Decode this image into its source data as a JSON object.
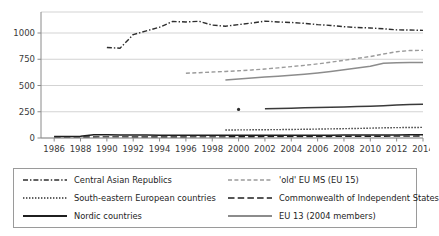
{
  "chart_data": {
    "type": "line",
    "title": "",
    "xlabel": "",
    "ylabel": "",
    "xlim": [
      1985,
      2014
    ],
    "ylim": [
      0,
      1200
    ],
    "yticks": [
      0,
      250,
      500,
      750,
      1000
    ],
    "xticks": [
      1986,
      1988,
      1990,
      1992,
      1994,
      1996,
      1998,
      2000,
      2002,
      2004,
      2006,
      2008,
      2010,
      2012,
      2014
    ],
    "grid": "horizontal",
    "legend_position": "below",
    "series": [
      {
        "name": "Central Asian Republics",
        "style": "dash-dot",
        "color": "#2e2e2e",
        "x": [
          1990,
          1991,
          1992,
          1993,
          1994,
          1995,
          1996,
          1997,
          1998,
          1999,
          2000,
          2001,
          2002,
          2003,
          2004,
          2005,
          2006,
          2007,
          2008,
          2009,
          2010,
          2011,
          2012,
          2013,
          2014
        ],
        "values": [
          862,
          855,
          985,
          1020,
          1055,
          1110,
          1105,
          1112,
          1075,
          1065,
          1080,
          1095,
          1113,
          1105,
          1100,
          1092,
          1080,
          1072,
          1060,
          1052,
          1048,
          1040,
          1030,
          1028,
          1025
        ]
      },
      {
        "name": "'old' EU MS (EU 15)",
        "style": "dash",
        "color": "#9b9b9b",
        "x": [
          1996,
          1997,
          1998,
          1999,
          2000,
          2001,
          2002,
          2003,
          2004,
          2005,
          2006,
          2007,
          2008,
          2009,
          2010,
          2011,
          2012,
          2013,
          2014
        ],
        "values": [
          617,
          622,
          628,
          634,
          640,
          648,
          657,
          668,
          680,
          692,
          706,
          722,
          740,
          758,
          776,
          800,
          822,
          833,
          835
        ]
      },
      {
        "name": "South-eastern European countries",
        "style": "dot",
        "color": "#2e2e2e",
        "x": [
          1999,
          2000,
          2001,
          2002,
          2003,
          2004,
          2005,
          2006,
          2007,
          2008,
          2009,
          2010,
          2011,
          2012,
          2013,
          2014
        ],
        "values": [
          76,
          77,
          78,
          79,
          80,
          81,
          83,
          85,
          87,
          89,
          91,
          94,
          97,
          99,
          100,
          101
        ]
      },
      {
        "name": "Commonwealth of Independent States",
        "style": "long-dash",
        "color": "#1f1f1f",
        "x": [
          1986,
          1987,
          1988,
          1989,
          1990,
          1991,
          1992,
          1993,
          1994,
          1995,
          1996,
          1997,
          1998,
          1999,
          2000,
          2001,
          2002,
          2003,
          2004,
          2005,
          2006,
          2007,
          2008,
          2009,
          2010,
          2011,
          2012,
          2013,
          2014
        ],
        "values": [
          9,
          9,
          10,
          10,
          11,
          11,
          10,
          10,
          10,
          10,
          10,
          11,
          11,
          11,
          12,
          12,
          13,
          13,
          14,
          14,
          15,
          15,
          16,
          16,
          17,
          17,
          18,
          18,
          19
        ]
      },
      {
        "name": "Nordic countries",
        "style": "solid",
        "color": "#1f1f1f",
        "x": [
          1986,
          1987,
          1988,
          1989,
          1990,
          1991,
          1992,
          1993,
          1994,
          1995,
          1996,
          1997,
          1998,
          1999,
          2000,
          2001,
          2002,
          2003,
          2004,
          2005,
          2006,
          2007,
          2008,
          2009,
          2010,
          2011,
          2012,
          2013,
          2014
        ],
        "values": [
          14,
          15,
          16,
          30,
          30,
          29,
          28,
          28,
          27,
          27,
          26,
          26,
          26,
          26,
          26,
          26,
          26,
          26,
          27,
          27,
          27,
          27,
          28,
          28,
          28,
          29,
          29,
          30,
          30
        ]
      },
      {
        "name": "EU 13 (2004 members)",
        "style": "solid",
        "color": "#8c8c8c",
        "x": [
          1999,
          2000,
          2001,
          2002,
          2003,
          2004,
          2005,
          2006,
          2007,
          2008,
          2009,
          2010,
          2011,
          2012,
          2013,
          2014
        ],
        "values": [
          553,
          562,
          572,
          580,
          588,
          598,
          608,
          620,
          634,
          650,
          666,
          683,
          712,
          716,
          718,
          720
        ]
      },
      {
        "name": "unnamed-marker-series",
        "style": "marker",
        "color": "#2e2e2e",
        "x": [
          2000
        ],
        "values": [
          272
        ]
      },
      {
        "name": "unnamed-mid-solid-series",
        "style": "solid",
        "color": "#3a3a3a",
        "x": [
          2002,
          2003,
          2004,
          2005,
          2006,
          2007,
          2008,
          2009,
          2010,
          2011,
          2012,
          2013,
          2014
        ],
        "values": [
          278,
          281,
          284,
          287,
          290,
          293,
          296,
          299,
          303,
          308,
          314,
          318,
          321
        ]
      }
    ]
  },
  "legend": {
    "items": [
      {
        "label": "Central Asian Republics",
        "style": "dash-dot",
        "color": "#2e2e2e"
      },
      {
        "label": "'old' EU MS (EU 15)",
        "style": "dash",
        "color": "#9b9b9b"
      },
      {
        "label": "South-eastern European countries",
        "style": "dot",
        "color": "#2e2e2e"
      },
      {
        "label": "Commonwealth of Independent States",
        "style": "long-dash",
        "color": "#1f1f1f"
      },
      {
        "label": "Nordic countries",
        "style": "solid",
        "color": "#1f1f1f"
      },
      {
        "label": "EU 13 (2004 members)",
        "style": "solid",
        "color": "#8c8c8c"
      }
    ]
  },
  "colors": {
    "grid": "#c8c8c8",
    "axis": "#8a8a8a",
    "text": "#2b2b2b",
    "background": "#ffffff",
    "legend_border": "#9a9a9a"
  }
}
